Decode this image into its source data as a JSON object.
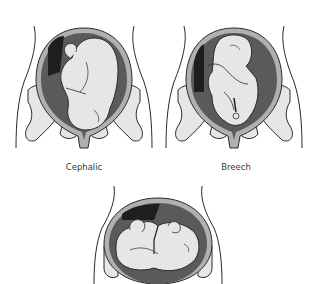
{
  "diagram": {
    "panels": [
      {
        "id": "cephalic",
        "label": "Cephalic"
      },
      {
        "id": "breech",
        "label": "Breech"
      },
      {
        "id": "transverse",
        "label": ""
      }
    ]
  },
  "colors": {
    "outline": "#2a2a2a",
    "body_fill": "#e6e6e6",
    "uterus_wall": "#b0b0b0",
    "amniotic_dark": "#5a5a5a",
    "shadow": "#1e1e1e",
    "background": "#ffffff"
  }
}
